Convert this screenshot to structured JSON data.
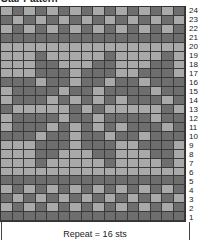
{
  "chart": {
    "title": "Star Pattern",
    "repeat_label": "Repeat = 16 sts",
    "colors": {
      "light": "#a9a9a9",
      "dark": "#6e6e6e",
      "grid_line": "#3a3a3a"
    },
    "row_labels": [
      "24",
      "23",
      "22",
      "21",
      "20",
      "19",
      "18",
      "17",
      "16",
      "15",
      "14",
      "13",
      "12",
      "11",
      "10",
      "9",
      "8",
      "7",
      "6",
      "5",
      "4",
      "3",
      "2",
      "1"
    ],
    "rows_top_to_bottom": [
      "LDLDLDLDLDLDLDLD",
      "DLDLDLDLDLDLDLDL",
      "LDLDLDLDLDLDLDLD",
      "DDDDDDDDDDDDDDDD",
      "LLLLLLLLLLLLLLLL",
      "LLLDLLLLLDLLLLDL",
      "LLLDDLLLDDLLLDDL",
      "LLLDDDLDDDLLDDDL",
      "DDDLDDLDDLDDLDDD",
      "LDDDDLDDLDDDDLDD",
      "LDDDLDLDLDLDDDLD",
      "DLLLLLDLDLLLLLDL",
      "LDDDDLDDLDDDDLDD",
      "LDDDLDLDLDLDDDLD",
      "DDDLDDLDDLDDLDDD",
      "LLLDDDLDDDLLDDDL",
      "LLLDDLLLDDLLLDDL",
      "LLLDLLLLLDLLLLDL",
      "LLLLLLLLLLLLLLLL",
      "DDDDDDDDDDDDDDDD",
      "LDLDLDLDLDLDLDLD",
      "DLDLDLDLDLDLDLDL",
      "LDLDLDLDLDLDLDLD",
      "DDDDDDDDDDDDDDDD"
    ]
  },
  "chart_data": {
    "type": "heatmap",
    "title": "Star Pattern",
    "xlabel": "Repeat = 16 sts",
    "ylabel": "Row",
    "columns": 16,
    "rows": 24,
    "legend": {
      "L": "light color",
      "D": "dark color"
    }
  }
}
